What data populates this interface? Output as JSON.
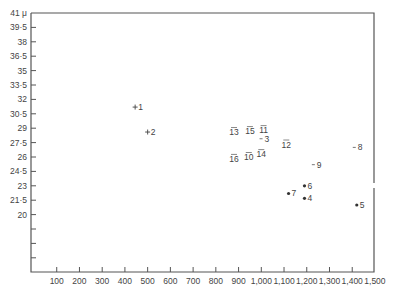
{
  "chart_data": {
    "type": "scatter",
    "title": "",
    "xlabel": "",
    "ylabel": "",
    "y_unit_label": "41 μ",
    "xlim": [
      0,
      1500
    ],
    "ylim": [
      14,
      41
    ],
    "grid": false,
    "legend": null,
    "x_ticks": [
      100,
      200,
      300,
      400,
      500,
      600,
      700,
      800,
      900,
      1000,
      1100,
      1200,
      1300,
      1400,
      1500
    ],
    "x_tick_labels": [
      "100",
      "200",
      "300",
      "400",
      "500",
      "600",
      "700",
      "800",
      "900",
      "1,000",
      "1,100",
      "1,200",
      "1,300",
      "1,400",
      "1,500"
    ],
    "y_ticks": [
      41,
      39.5,
      38,
      36.5,
      35,
      33.5,
      32,
      30.5,
      29,
      27.5,
      26,
      24.5,
      23,
      21.5,
      20,
      18.5,
      17,
      15.5
    ],
    "y_tick_labels": [
      "41 μ",
      "39·5",
      "38",
      "36·5",
      "35",
      "33·5",
      "32",
      "30·5",
      "29",
      "27·5",
      "26",
      "24·5",
      "23",
      "21·5",
      "20",
      "",
      "",
      ""
    ],
    "points": [
      {
        "id": "1",
        "marker": "+",
        "x": 445,
        "y": 31.2
      },
      {
        "id": "2",
        "marker": "+",
        "x": 500,
        "y": 28.6
      },
      {
        "id": "3",
        "marker": "-",
        "x": 1010,
        "y": 27.9
      },
      {
        "id": "4",
        "marker": "•",
        "x": 1190,
        "y": 21.7
      },
      {
        "id": "5",
        "marker": "•",
        "x": 1420,
        "y": 21.0
      },
      {
        "id": "6",
        "marker": "•",
        "x": 1190,
        "y": 23.0
      },
      {
        "id": "7",
        "marker": "•",
        "x": 1120,
        "y": 22.2
      },
      {
        "id": "8",
        "marker": "-",
        "x": 1420,
        "y": 27.0
      },
      {
        "id": "9",
        "marker": "-",
        "x": 1240,
        "y": 25.2
      },
      {
        "id": "10",
        "marker": "-",
        "x": 945,
        "y": 26.0
      },
      {
        "id": "11",
        "marker": "-",
        "x": 1010,
        "y": 28.8
      },
      {
        "id": "12",
        "marker": "-",
        "x": 1110,
        "y": 27.3
      },
      {
        "id": "13",
        "marker": "-",
        "x": 880,
        "y": 28.6
      },
      {
        "id": "14",
        "marker": "-",
        "x": 1000,
        "y": 26.3
      },
      {
        "id": "15",
        "marker": "-",
        "x": 950,
        "y": 28.7
      },
      {
        "id": "16",
        "marker": "-",
        "x": 880,
        "y": 25.8
      }
    ]
  }
}
